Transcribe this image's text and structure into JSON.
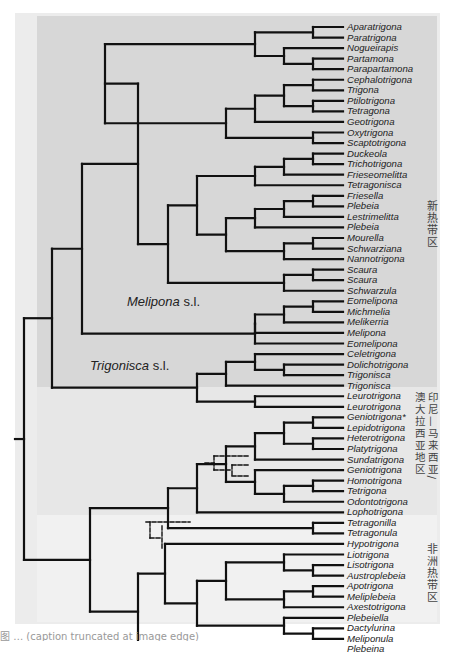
{
  "figure": {
    "type": "phylogenetic-tree",
    "colors": {
      "neotropical_bg": "#d7d7d7",
      "indomalayan_bg": "#e7e7e7",
      "afrotropical_bg": "#f1f1f1",
      "frame_bg": "#ececec",
      "branch": "#111111"
    },
    "regions": [
      {
        "id": "neotropical",
        "label": "新热带区"
      },
      {
        "id": "indomalayan",
        "label": "印尼—马来西亚/澳大拉西亚地区"
      },
      {
        "id": "afrotropical",
        "label": "非洲热带区"
      }
    ],
    "clade_labels": [
      {
        "genus": "Melipona",
        "suffix": " s.l."
      },
      {
        "genus": "Trigonisca",
        "suffix": " s.l."
      }
    ],
    "taxa": [
      "Aparatrigona",
      "Paratrigona",
      "Nogueirapis",
      "Partamona",
      "Parapartamona",
      "Cephalotrigona",
      "Trigona",
      "Ptilotrigona",
      "Tetragona",
      "Geotrigona",
      "Oxytrigona",
      "Scaptotrigona",
      "Duckeola",
      "Trichotrigona",
      "Frieseomelitta",
      "Tetragonisca",
      "Friesella",
      "Plebeia",
      "Lestrimelitta",
      "Plebeia",
      "Mourella",
      "Schwarziana",
      "Nannotrigona",
      "Scaura",
      "Scaura",
      "Schwarzula",
      "Eomelipona",
      "Michmelia",
      "Melikerria",
      "Melipona",
      "Eomelipona",
      "Celetrigona",
      "Dolichotrigona",
      "Trigonisca",
      "Trigonisca",
      "Leurotrigona",
      "Leurotrigona",
      "Geniotrigona*",
      "Lepidotrigona",
      "Heterotrigona",
      "Platytrigona",
      "Sundatrigona",
      "Geniotrigona",
      "Homotrigona",
      "Tetrigona",
      "Odontotrigona",
      "Lophotrigona",
      "Tetragonilla",
      "Tetragonula",
      "Hypotrigona",
      "Liotrigona",
      "Lisotrigona",
      "Austroplebeia",
      "Apotrigona",
      "Meliplebeia",
      "Axestotrigona",
      "Plebeiella",
      "Dactylurina",
      "Meliponula",
      "Plebeina"
    ],
    "caption": "图 … (caption truncated at image edge)"
  }
}
